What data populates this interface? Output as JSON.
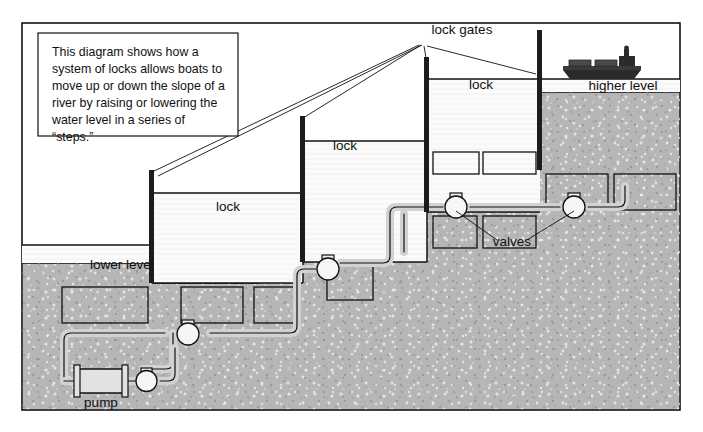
{
  "diagram": {
    "caption": {
      "lines": [
        "This diagram shows how a",
        "system of locks allows boats to",
        "move up or down the slope of a",
        "river by raising or lowering the",
        "water level in a series of",
        "“steps.”"
      ]
    },
    "labels": {
      "lock_gates": "lock gates",
      "higher_level": "higher level",
      "lower_level": "lower level",
      "valves": "valves",
      "pump": "pump",
      "lock_1": "lock",
      "lock_2": "lock",
      "lock_3": "lock"
    },
    "colors": {
      "ground": "#b6b6b6",
      "water": "#fbfbfb",
      "gate": "#1c1c1c",
      "pipe": "#d0d0d0",
      "outline": "#111111",
      "boat": "#2b2b2b",
      "frame": "#111111",
      "background": "#ffffff"
    },
    "parts": {
      "gate_count": 4,
      "valve_count": 4,
      "lock_count": 3,
      "pump_count": 1,
      "boat_count": 1
    }
  }
}
